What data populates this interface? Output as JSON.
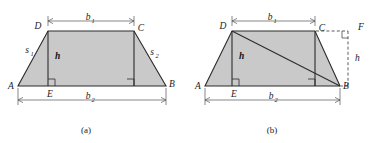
{
  "figure": {
    "background_color": "#ffffff",
    "fill_color": "#c9c9c9",
    "line_color": "#2b2b2b",
    "panels": [
      {
        "caption": "(a)",
        "description": "Trapezoid ABCD with parallel sides b1 (top, DC) and b2 (bottom, AB), height h from D to E on AB, legs s1 and s2",
        "vertices": [
          "A",
          "B",
          "C",
          "D",
          "E"
        ],
        "labels": {
          "A": "A",
          "B": "B",
          "C": "C",
          "D": "D",
          "E": "E",
          "h": "h",
          "b1_base": "b",
          "b1_sub": "1",
          "b2_base": "b",
          "b2_sub": "2",
          "s1_base": "s",
          "s1_sub": "1",
          "s2_base": "s",
          "s2_sub": "2"
        }
      },
      {
        "caption": "(b)",
        "description": "Same trapezoid ABCD split by diagonal DB into two triangles; dashed segment from C to F and from F down to B shows the second height h; right angle at F",
        "vertices": [
          "A",
          "B",
          "C",
          "D",
          "E",
          "F"
        ],
        "labels": {
          "A": "A",
          "B": "B",
          "C": "C",
          "D": "D",
          "E": "E",
          "F": "F",
          "h_left": "h",
          "h_right": "h",
          "b1_base": "b",
          "b1_sub": "1",
          "b2_base": "b",
          "b2_sub": "2"
        }
      }
    ]
  }
}
